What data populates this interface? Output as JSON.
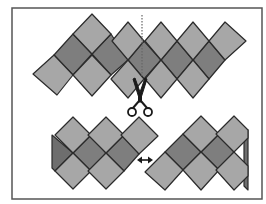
{
  "figure": {
    "colors": {
      "background": "#ffffff",
      "frame": "#555555",
      "light_tile": "#a7a7a7",
      "dark_tile": "#7e7e7e",
      "side_face": "#6e6e6e",
      "outline": "#2b2b2b",
      "cut_line": "#666666",
      "icon": "#1a1a1a"
    },
    "frame": {
      "x": 12,
      "y": 8,
      "w": 250,
      "h": 191
    },
    "top_piece": {
      "light_tiles": [
        "92,14 111,34 92,54 73,34",
        "128,22 144,41 128,60 112,41",
        "161,22 177,41 161,60 145,41",
        "193,22 209,41 193,60 177,41",
        "225,22 246,41 225,60 209,41",
        "54,55 73,75 57,95 33,74",
        "92,55 111,75 92,96 73,75",
        "128,60 144,79 128,98 111,79",
        "161,60 177,79 161,98 145,79",
        "193,60 209,79 193,98 177,79"
      ],
      "dark_tiles": [
        "73,34 92,54 73,75 54,55",
        "111,34 128,60 111,75 92,54",
        "144,41 161,60 144,79 128,60",
        "177,41 193,60 177,79 161,60",
        "209,41 225,60 209,79 193,60"
      ],
      "cut_line": {
        "x": 142,
        "y1": 15,
        "y2": 76
      }
    },
    "bottom_left_piece": {
      "light_tiles": [
        "73,117 91,135 73,153 55,135",
        "106,117 124,135 106,153 88,135",
        "139,117 158,136 139,154 121,135",
        "73,153 91,171 73,189 55,171",
        "106,153 124,171 106,189 88,171"
      ],
      "dark_tiles": [
        "91,135 106,153 91,171 73,153",
        "124,135 139,154 124,171 106,153"
      ],
      "side_face": "52,135 73,153 55,171 52,168"
    },
    "bottom_right_piece": {
      "light_tiles": [
        "201,116 219,134 201,152 183,134",
        "234,116 248,130 248,138 234,152 216,134",
        "165,152 183,170 165,190 145,172",
        "201,152 219,170 201,190 183,170",
        "234,152 248,166 248,176 234,190 216,170"
      ],
      "dark_tiles": [
        "183,134 201,152 183,170 165,152",
        "219,134 234,152 219,170 201,152"
      ],
      "side_face": "248,130 248,190 244,186 244,134"
    },
    "icons": {
      "scissors": {
        "name": "scissors-icon",
        "x": 140,
        "y": 78
      },
      "double_arrow": {
        "name": "double-arrow-icon",
        "x1": 137,
        "x2": 153,
        "y": 160
      }
    }
  }
}
